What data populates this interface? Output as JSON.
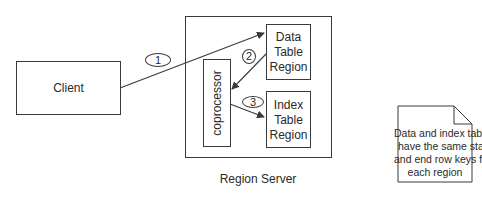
{
  "diagram": {
    "client": {
      "label": "Client"
    },
    "region_server": {
      "label": "Region Server",
      "coprocessor": {
        "label": "coprocessor"
      },
      "data_region": {
        "lines": [
          "Data",
          "Table",
          "Region"
        ]
      },
      "index_region": {
        "lines": [
          "Index",
          "Table",
          "Region"
        ]
      }
    },
    "steps": [
      {
        "number": "1",
        "from": "Client",
        "to": "Data Table Region"
      },
      {
        "number": "2",
        "from": "Data Table Region",
        "to": "coprocessor"
      },
      {
        "number": "3",
        "from": "coprocessor",
        "to": "Index Table Region"
      }
    ],
    "note": {
      "lines": [
        "Data and index tables",
        "have the same start",
        "and end row keys for",
        "each region"
      ]
    },
    "colors": {
      "stroke": "#3a3a3a",
      "text": "#2a2a2a",
      "background": "#ffffff"
    }
  }
}
